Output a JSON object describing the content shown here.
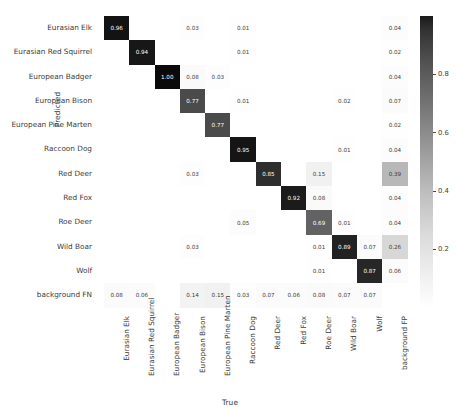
{
  "axes": {
    "ylabel": "Predicted",
    "xlabel": "True"
  },
  "classes": [
    "Eurasian Elk",
    "Eurasian Red Squirrel",
    "European Badger",
    "European Bison",
    "European Pine Marten",
    "Raccoon Dog",
    "Red Deer",
    "Red Fox",
    "Roe Deer",
    "Wild Boar",
    "Wolf",
    "background FN"
  ],
  "x_classes": [
    "Eurasian Elk",
    "Eurasian Red Squirrel",
    "European Badger",
    "European Bison",
    "European Pine Marten",
    "Raccoon Dog",
    "Red Deer",
    "Red Fox",
    "Roe Deer",
    "Wild Boar",
    "Wolf",
    "background FP"
  ],
  "colorbar": {
    "ticks": [
      "0.8",
      "0.6",
      "0.4",
      "0.2"
    ],
    "cmap": "Greys",
    "vmin": 0,
    "vmax": 1
  },
  "chart_data": {
    "type": "heatmap",
    "title": "",
    "xlabel": "True",
    "ylabel": "Predicted",
    "normalized": true,
    "xticklabels": [
      "Eurasian Elk",
      "Eurasian Red Squirrel",
      "European Badger",
      "European Bison",
      "European Pine Marten",
      "Raccoon Dog",
      "Red Deer",
      "Red Fox",
      "Roe Deer",
      "Wild Boar",
      "Wolf",
      "background FP"
    ],
    "yticklabels": [
      "Eurasian Elk",
      "Eurasian Red Squirrel",
      "European Badger",
      "European Bison",
      "European Pine Marten",
      "Raccoon Dog",
      "Red Deer",
      "Red Fox",
      "Roe Deer",
      "Wild Boar",
      "Wolf",
      "background FN"
    ],
    "colorbar_ticks": [
      0.2,
      0.4,
      0.6,
      0.8
    ],
    "values": [
      [
        0.96,
        null,
        null,
        0.03,
        null,
        0.01,
        null,
        null,
        null,
        null,
        null,
        0.04
      ],
      [
        null,
        0.94,
        null,
        null,
        null,
        0.01,
        null,
        null,
        null,
        null,
        null,
        0.02
      ],
      [
        null,
        null,
        1.0,
        0.08,
        0.03,
        null,
        null,
        null,
        null,
        null,
        null,
        0.04
      ],
      [
        null,
        null,
        null,
        0.77,
        null,
        0.01,
        null,
        null,
        null,
        0.02,
        null,
        0.07
      ],
      [
        null,
        null,
        null,
        null,
        0.77,
        null,
        null,
        null,
        null,
        null,
        null,
        0.02
      ],
      [
        null,
        null,
        null,
        null,
        null,
        0.95,
        null,
        null,
        null,
        0.01,
        null,
        0.04
      ],
      [
        null,
        null,
        null,
        0.03,
        null,
        null,
        0.85,
        null,
        0.15,
        null,
        null,
        0.39
      ],
      [
        null,
        null,
        null,
        null,
        null,
        null,
        null,
        0.92,
        0.08,
        null,
        null,
        0.04
      ],
      [
        null,
        null,
        null,
        null,
        null,
        0.05,
        null,
        null,
        0.69,
        0.01,
        null,
        0.04
      ],
      [
        null,
        null,
        null,
        0.03,
        null,
        null,
        null,
        null,
        0.01,
        0.89,
        0.07,
        0.26
      ],
      [
        null,
        null,
        null,
        null,
        null,
        null,
        null,
        null,
        0.01,
        null,
        0.87,
        0.06
      ],
      [
        0.08,
        0.06,
        null,
        0.14,
        0.15,
        0.03,
        0.07,
        0.06,
        0.08,
        0.07,
        0.07,
        null
      ]
    ]
  }
}
